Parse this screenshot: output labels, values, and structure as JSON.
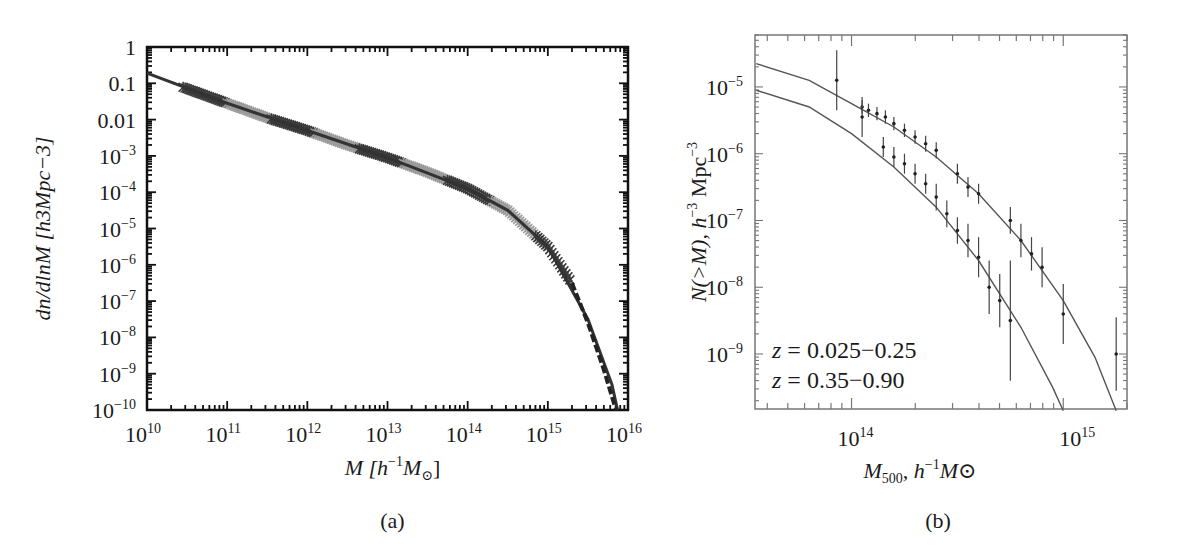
{
  "chart_data": [
    {
      "panel": "(a)",
      "type": "scatter",
      "caption": "(a)",
      "xlabel": "M [h^-1 M_sun]",
      "xlabel_parts": {
        "main": "M [h",
        "sup": "−1",
        "tail": "M",
        "sub": "⊙",
        "close": "]"
      },
      "ylabel": "dn/dlnM [h3Mpc−3]",
      "xscale": "log",
      "yscale": "log",
      "xlim": [
        10000000000.0,
        1e+16
      ],
      "ylim": [
        1e-10,
        1
      ],
      "x_ticks": [
        {
          "base": "10",
          "exp": "10"
        },
        {
          "base": "10",
          "exp": "11"
        },
        {
          "base": "10",
          "exp": "12"
        },
        {
          "base": "10",
          "exp": "13"
        },
        {
          "base": "10",
          "exp": "14"
        },
        {
          "base": "10",
          "exp": "15"
        },
        {
          "base": "10",
          "exp": "16"
        }
      ],
      "y_ticks": [
        {
          "text": "1"
        },
        {
          "text": "0.1"
        },
        {
          "text": "0.01"
        },
        {
          "base": "10",
          "exp": "−3"
        },
        {
          "base": "10",
          "exp": "−4"
        },
        {
          "base": "10",
          "exp": "−5"
        },
        {
          "base": "10",
          "exp": "−6"
        },
        {
          "base": "10",
          "exp": "−7"
        },
        {
          "base": "10",
          "exp": "−8"
        },
        {
          "base": "10",
          "exp": "−9"
        },
        {
          "base": "10",
          "exp": "−10"
        }
      ],
      "series": [
        {
          "name": "simulation mass function (multiple runs, crosses)",
          "x_log10": [
            10.0,
            10.5,
            11.0,
            11.5,
            12.0,
            12.5,
            13.0,
            13.5,
            14.0,
            14.5,
            15.0,
            15.3,
            15.5,
            15.7,
            15.85
          ],
          "y_log10": [
            -0.75,
            -1.15,
            -1.55,
            -1.95,
            -2.3,
            -2.7,
            -3.05,
            -3.45,
            -3.9,
            -4.5,
            -5.5,
            -6.5,
            -7.6,
            -8.9,
            -10.0
          ]
        },
        {
          "name": "analytic fit (line)",
          "x_log10": [
            10.0,
            11.0,
            12.0,
            13.0,
            14.0,
            14.5,
            15.0,
            15.5,
            15.8,
            15.87
          ],
          "y_log10": [
            -0.72,
            -1.55,
            -2.3,
            -3.05,
            -3.9,
            -4.5,
            -5.5,
            -7.5,
            -9.3,
            -10.0
          ]
        }
      ],
      "grid": false
    },
    {
      "panel": "(b)",
      "type": "scatter",
      "caption": "(b)",
      "xlabel": "M500, h^-1 M_sun",
      "xlabel_parts": {
        "main": "M",
        "sub": "500",
        "mid": ", h",
        "sup": "−1",
        "tail": "M⊙"
      },
      "ylabel": "N(>M), h^-3 Mpc^-3",
      "ylabel_parts": {
        "main": "N(>M), h",
        "sup": "−3",
        "tail": " Mpc",
        "sup2": "−3"
      },
      "xscale": "log",
      "yscale": "log",
      "xlim": [
        35000000000000.0,
        2000000000000000.0
      ],
      "ylim": [
        1.5e-10,
        6e-05
      ],
      "x_ticks": [
        {
          "base": "10",
          "exp": "14"
        },
        {
          "base": "10",
          "exp": "15"
        }
      ],
      "y_ticks": [
        {
          "base": "10",
          "exp": "−5"
        },
        {
          "base": "10",
          "exp": "−6"
        },
        {
          "base": "10",
          "exp": "−7"
        },
        {
          "base": "10",
          "exp": "−8"
        },
        {
          "base": "10",
          "exp": "−9"
        }
      ],
      "legend": [
        {
          "label": "z = 0.025−0.25",
          "var": "z",
          "eq": " = 0.025−0.25"
        },
        {
          "label": "z = 0.35−0.90",
          "var": "z",
          "eq": " = 0.35−0.90"
        }
      ],
      "series": [
        {
          "name": "z = 0.025−0.25 (data with error bars)",
          "x_log10": [
            13.93,
            14.05,
            14.08,
            14.12,
            14.16,
            14.2,
            14.25,
            14.3,
            14.35,
            14.4,
            14.5,
            14.55,
            14.6,
            14.75,
            14.8,
            14.85,
            14.9,
            15.0,
            15.25
          ],
          "y_log10": [
            -4.9,
            -5.3,
            -5.35,
            -5.4,
            -5.45,
            -5.55,
            -5.65,
            -5.75,
            -5.85,
            -5.95,
            -6.3,
            -6.5,
            -6.6,
            -7.0,
            -7.3,
            -7.5,
            -7.7,
            -8.4,
            -9.0
          ],
          "yerr_log10": [
            0.45,
            0.1,
            0.1,
            0.1,
            0.1,
            0.1,
            0.1,
            0.1,
            0.12,
            0.12,
            0.15,
            0.15,
            0.15,
            0.2,
            0.25,
            0.25,
            0.3,
            0.45,
            0.55
          ]
        },
        {
          "name": "z = 0.025−0.25 fit",
          "x_log10": [
            13.55,
            13.8,
            14.0,
            14.2,
            14.4,
            14.6,
            14.8,
            15.0,
            15.15,
            15.25
          ],
          "y_log10": [
            -4.65,
            -4.9,
            -5.25,
            -5.6,
            -6.05,
            -6.6,
            -7.3,
            -8.2,
            -9.05,
            -9.85
          ]
        },
        {
          "name": "z = 0.35−0.90 (data with error bars)",
          "x_log10": [
            14.05,
            14.15,
            14.2,
            14.25,
            14.3,
            14.35,
            14.4,
            14.45,
            14.5,
            14.55,
            14.6,
            14.65,
            14.7,
            14.75
          ],
          "y_log10": [
            -5.45,
            -5.9,
            -6.05,
            -6.15,
            -6.3,
            -6.45,
            -6.65,
            -6.9,
            -7.15,
            -7.3,
            -7.55,
            -8.0,
            -8.2,
            -8.5
          ],
          "yerr_log10": [
            0.3,
            0.15,
            0.15,
            0.15,
            0.15,
            0.15,
            0.2,
            0.2,
            0.2,
            0.25,
            0.3,
            0.4,
            0.4,
            0.9
          ]
        },
        {
          "name": "z = 0.35−0.90 fit",
          "x_log10": [
            13.55,
            13.8,
            14.0,
            14.2,
            14.4,
            14.6,
            14.8,
            14.95,
            15.0
          ],
          "y_log10": [
            -5.05,
            -5.3,
            -5.7,
            -6.2,
            -6.8,
            -7.6,
            -8.6,
            -9.5,
            -9.85
          ]
        }
      ],
      "grid": false
    }
  ]
}
